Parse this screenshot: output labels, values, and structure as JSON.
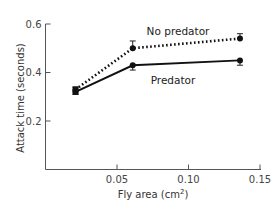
{
  "chart_data": {
    "type": "line",
    "title": "",
    "xlabel": "Fly area (cm",
    "xlabel_sup": "2",
    "xlabel_end": ")",
    "ylabel": "Attack time (seconds)",
    "xlim": [
      0,
      0.15
    ],
    "ylim": [
      0,
      0.6
    ],
    "xticks": [
      0.05,
      0.1,
      0.15
    ],
    "xtick_labels": [
      "0.05",
      "0.10",
      "0.15"
    ],
    "yticks": [
      0.2,
      0.4,
      0.6
    ],
    "ytick_labels": [
      "0.2",
      "0.4",
      "0.6"
    ],
    "grid": false,
    "legend": "inline labels",
    "series": [
      {
        "name": "No predator",
        "style": "dotted",
        "x": [
          0.021,
          0.061,
          0.136
        ],
        "y": [
          0.33,
          0.5,
          0.54
        ],
        "error": [
          0.01,
          0.03,
          0.02
        ]
      },
      {
        "name": "Predator",
        "style": "solid",
        "x": [
          0.021,
          0.061,
          0.136
        ],
        "y": [
          0.32,
          0.43,
          0.45
        ],
        "error": [
          0.01,
          0.02,
          0.02
        ]
      }
    ]
  }
}
